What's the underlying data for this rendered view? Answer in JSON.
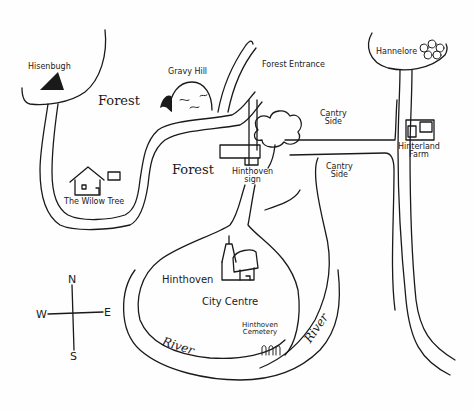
{
  "map": {
    "style": "hand-drawn sketch map",
    "ink_color": "#1a1a1a",
    "background_color": "#fefefe",
    "locations": [
      {
        "id": "hisenbugh",
        "label": "Hisenbugh",
        "icon": "mountain-icon"
      },
      {
        "id": "gravy-hill",
        "label": "Gravy Hill",
        "icon": "hill-icon"
      },
      {
        "id": "forest-entrance",
        "label": "Forest Entrance"
      },
      {
        "id": "hannelore",
        "label": "Hannelore",
        "icon": "flowers-icon"
      },
      {
        "id": "hinterland-farm",
        "label_line1": "Hinterland",
        "label_line2": "Farm",
        "icon": "farmhouse-icon"
      },
      {
        "id": "willow-tree",
        "label": "The Wilow Tree",
        "icon": "house-icon"
      },
      {
        "id": "hinthoven-sign",
        "label_line1": "Hinthoven",
        "label_line2": "sign",
        "icon": "sign-icon"
      },
      {
        "id": "hinthoven-city-centre",
        "label_line1": "Hinthoven",
        "label_line2": "City Centre",
        "icon": "castle-icon"
      },
      {
        "id": "hinthoven-cemetery",
        "label_line1": "Hinthoven",
        "label_line2": "Cemetery",
        "icon": "gravestones-icon"
      }
    ],
    "regions": {
      "forest_1": "Forest",
      "forest_2": "Forest",
      "countryside_1_line1": "Cantry",
      "countryside_1_line2": "Side",
      "countryside_2_line1": "Cantry",
      "countryside_2_line2": "Side",
      "river_1": "River",
      "river_2": "River"
    },
    "compass": {
      "north": "N",
      "south": "S",
      "east": "E",
      "west": "W"
    }
  }
}
